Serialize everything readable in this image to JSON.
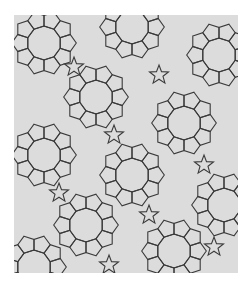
{
  "image": {
    "description": "Penrose-like tiling of decagons, pentagons and pentagram stars",
    "colors": {
      "background": "#ffffff",
      "tile_fill": "#dcdcdc",
      "edge": "#3a3a3a"
    },
    "panel": {
      "x": 14,
      "y": 15,
      "width": 224,
      "height": 258
    },
    "decagon_radius": 17,
    "decagons": [
      [
        30,
        28
      ],
      [
        118,
        12
      ],
      [
        205,
        40
      ],
      [
        82,
        82
      ],
      [
        170,
        108
      ],
      [
        30,
        140
      ],
      [
        118,
        160
      ],
      [
        210,
        190
      ],
      [
        72,
        210
      ],
      [
        160,
        236
      ],
      [
        20,
        252
      ]
    ]
  }
}
